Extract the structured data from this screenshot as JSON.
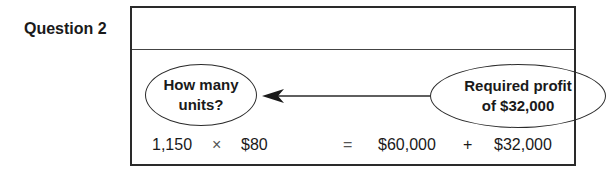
{
  "question_label": "Question 2",
  "diagram": {
    "oval_left": [
      "How many",
      "units?"
    ],
    "oval_right": [
      "Required profit",
      "of $32,000"
    ],
    "equation": {
      "units": "1,150",
      "times": "×",
      "price": "$80",
      "equals": "=",
      "fixed_cost": "$60,000",
      "plus": "+",
      "profit": "$32,000"
    }
  }
}
